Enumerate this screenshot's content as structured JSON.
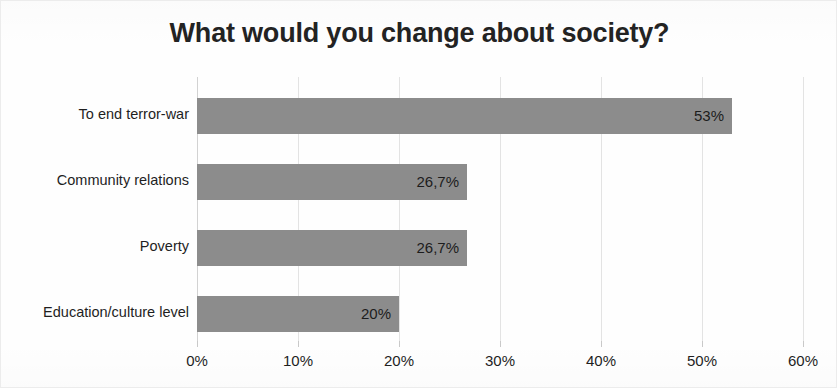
{
  "chart_data": {
    "type": "bar",
    "orientation": "horizontal",
    "title": "What would you change about society?",
    "xlabel": "",
    "ylabel": "",
    "categories": [
      "To end terror-war",
      "Community relations",
      "Poverty",
      "Education/culture level"
    ],
    "values": [
      53,
      26.7,
      26.7,
      20
    ],
    "data_labels": [
      "53%",
      "26,7%",
      "26,7%",
      "20%"
    ],
    "xlim": [
      0,
      60
    ],
    "xticks": [
      0,
      10,
      20,
      30,
      40,
      50,
      60
    ],
    "xtick_labels": [
      "0%",
      "10%",
      "20%",
      "30%",
      "40%",
      "50%",
      "60%"
    ],
    "grid": true,
    "grid_axis": "x",
    "legend": false,
    "bar_color": "#8c8c8c",
    "text_color": "#1f1f1f",
    "gridline_color": "#e3e3e3",
    "background_color": "#fefefe"
  }
}
